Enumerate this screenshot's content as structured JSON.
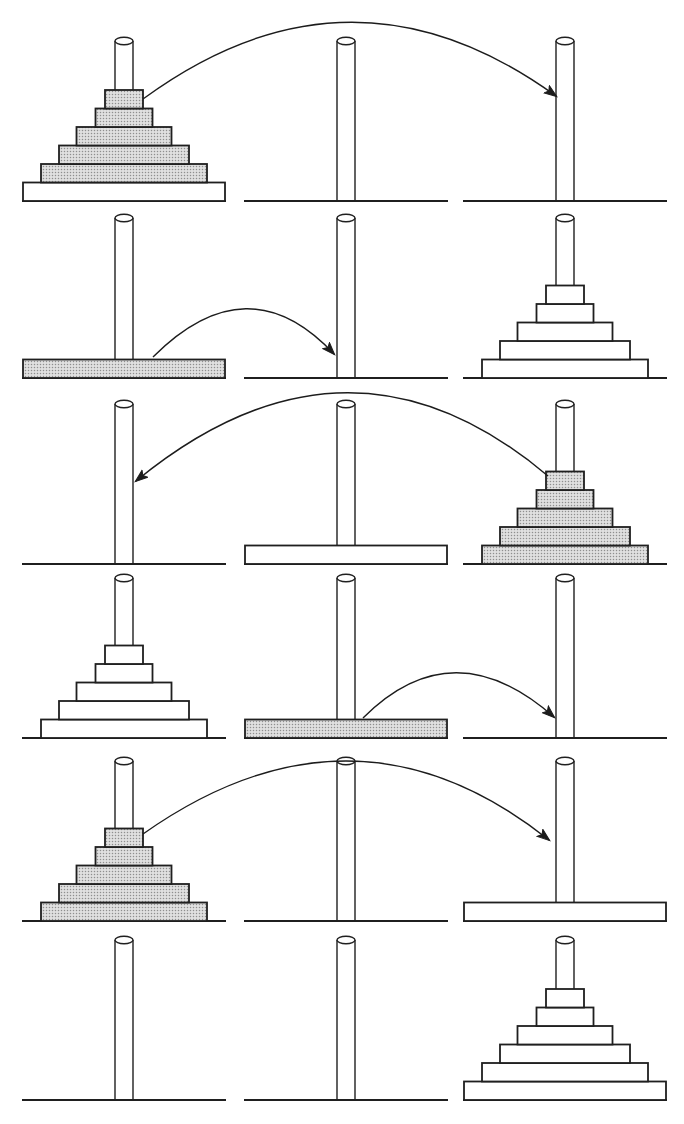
{
  "diagram": {
    "type": "towers-of-hanoi-recursive-solution-steps",
    "canvas": {
      "width": 684,
      "height": 1124,
      "background": "#ffffff"
    },
    "style": {
      "outline_color": "#1f1f1f",
      "arrow_color": "#1c1c1c",
      "disk_plain_fill": "#ffffff",
      "disk_shaded_base": "#e0e0e0",
      "disk_shaded_dot": "#8f8f8f",
      "peg_fill": "#ffffff",
      "baseline_stroke_width": 1.8,
      "peg_stroke_width": 1.4,
      "disk_stroke_width": 1.8,
      "arrow_stroke_width": 1.4
    },
    "geometry": {
      "baseline_y": [
        201,
        378,
        564,
        738,
        921,
        1100
      ],
      "peg_x": [
        124,
        346,
        565
      ],
      "baseline_half_width": 102,
      "peg_width": 18,
      "peg_height": 160,
      "peg_ellipse_ry": 3.8,
      "disk_height": 18.5,
      "disk_widths_by_size": [
        38,
        57,
        95,
        130,
        166,
        202
      ]
    },
    "peg_names": [
      "left",
      "middle",
      "right"
    ],
    "rows": [
      {
        "label": "step-1",
        "stacks": [
          [
            {
              "size": 6,
              "shaded": false
            },
            {
              "size": 5,
              "shaded": true
            },
            {
              "size": 4,
              "shaded": true
            },
            {
              "size": 3,
              "shaded": true
            },
            {
              "size": 2,
              "shaded": true
            },
            {
              "size": 1,
              "shaded": true
            }
          ],
          [],
          []
        ],
        "arrow": {
          "from_peg": "left",
          "to_peg": "right",
          "tail": [
            143,
            99
          ],
          "ctrl": [
            350,
            -53
          ],
          "head": [
            556,
            96
          ]
        }
      },
      {
        "label": "step-2",
        "stacks": [
          [
            {
              "size": 6,
              "shaded": true
            }
          ],
          [],
          [
            {
              "size": 5,
              "shaded": false
            },
            {
              "size": 4,
              "shaded": false
            },
            {
              "size": 3,
              "shaded": false
            },
            {
              "size": 2,
              "shaded": false
            },
            {
              "size": 1,
              "shaded": false
            }
          ]
        ],
        "arrow": {
          "from_peg": "left",
          "to_peg": "middle",
          "tail": [
            153,
            357
          ],
          "ctrl": [
            248,
            262
          ],
          "head": [
            334,
            354
          ]
        }
      },
      {
        "label": "step-3",
        "stacks": [
          [],
          [
            {
              "size": 6,
              "shaded": false
            }
          ],
          [
            {
              "size": 5,
              "shaded": true
            },
            {
              "size": 4,
              "shaded": true
            },
            {
              "size": 3,
              "shaded": true
            },
            {
              "size": 2,
              "shaded": true
            },
            {
              "size": 1,
              "shaded": true
            }
          ]
        ],
        "arrow": {
          "from_peg": "right",
          "to_peg": "left",
          "tail": [
            548,
            476
          ],
          "ctrl": [
            348,
            307
          ],
          "head": [
            136,
            481
          ]
        }
      },
      {
        "label": "step-4",
        "stacks": [
          [
            {
              "size": 5,
              "shaded": false
            },
            {
              "size": 4,
              "shaded": false
            },
            {
              "size": 3,
              "shaded": false
            },
            {
              "size": 2,
              "shaded": false
            },
            {
              "size": 1,
              "shaded": false
            }
          ],
          [
            {
              "size": 6,
              "shaded": true
            }
          ],
          []
        ],
        "arrow": {
          "from_peg": "middle",
          "to_peg": "right",
          "tail": [
            363,
            718
          ],
          "ctrl": [
            453,
            628
          ],
          "head": [
            554,
            717
          ]
        }
      },
      {
        "label": "step-5",
        "stacks": [
          [
            {
              "size": 5,
              "shaded": true
            },
            {
              "size": 4,
              "shaded": true
            },
            {
              "size": 3,
              "shaded": true
            },
            {
              "size": 2,
              "shaded": true
            },
            {
              "size": 1,
              "shaded": true
            }
          ],
          [],
          [
            {
              "size": 6,
              "shaded": false
            }
          ]
        ],
        "arrow": {
          "from_peg": "left",
          "to_peg": "right",
          "tail": [
            143,
            834
          ],
          "ctrl": [
            354,
            685
          ],
          "head": [
            549,
            840
          ]
        }
      },
      {
        "label": "step-6",
        "stacks": [
          [],
          [],
          [
            {
              "size": 6,
              "shaded": false
            },
            {
              "size": 5,
              "shaded": false
            },
            {
              "size": 4,
              "shaded": false
            },
            {
              "size": 3,
              "shaded": false
            },
            {
              "size": 2,
              "shaded": false
            },
            {
              "size": 1,
              "shaded": false
            }
          ]
        ],
        "arrow": null
      }
    ]
  }
}
